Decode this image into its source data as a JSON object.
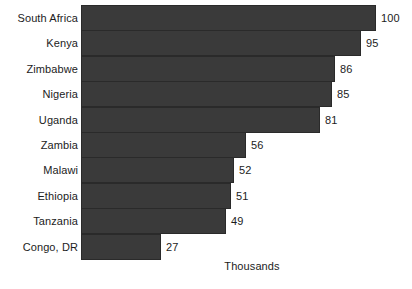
{
  "chart_data": {
    "type": "bar",
    "orientation": "horizontal",
    "title": "",
    "subtitle": "",
    "xlabel": "Thousands",
    "ylabel": "",
    "categories": [
      "South Africa",
      "Kenya",
      "Zimbabwe",
      "Nigeria",
      "Uganda",
      "Zambia",
      "Malawi",
      "Ethiopia",
      "Tanzania",
      "Congo, DR"
    ],
    "values": [
      100,
      95,
      86,
      85,
      81,
      56,
      52,
      51,
      49,
      27
    ],
    "value_labels": [
      "100",
      "95",
      "86",
      "85",
      "81",
      "56",
      "52",
      "51",
      "49",
      "27"
    ],
    "xlim": [
      0,
      100
    ],
    "grid": false,
    "legend": false,
    "axis_ticks_visible": false,
    "bar_color": "#3a3a3a",
    "bar_edge_color": "#2a2a2a",
    "text_color": "#1c1c1c",
    "background_color": "#ffffff"
  },
  "axis": {
    "x_title": "Thousands"
  }
}
